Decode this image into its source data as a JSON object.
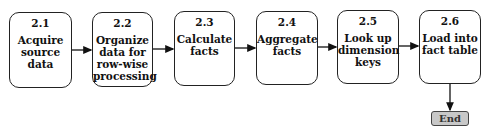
{
  "diagram": {
    "steps": [
      {
        "id": "2.1",
        "label": "Acquire source data",
        "lines": [
          "Acquire",
          "source",
          "data"
        ]
      },
      {
        "id": "2.2",
        "label": "Organize data for row-wise processing",
        "lines": [
          "Organize",
          "data for",
          "row-wise",
          "processing"
        ]
      },
      {
        "id": "2.3",
        "label": "Calculate facts",
        "lines": [
          "Calculate",
          "facts"
        ]
      },
      {
        "id": "2.4",
        "label": "Aggregate facts",
        "lines": [
          "Aggregate",
          "facts"
        ]
      },
      {
        "id": "2.5",
        "label": "Look up dimension keys",
        "lines": [
          "Look up",
          "dimension",
          "keys"
        ]
      },
      {
        "id": "2.6",
        "label": "Load into fact table",
        "lines": [
          "Load into",
          "fact table"
        ]
      }
    ],
    "end": {
      "label": "End"
    },
    "edges": [
      {
        "from": "2.1",
        "to": "2.2"
      },
      {
        "from": "2.2",
        "to": "2.3"
      },
      {
        "from": "2.3",
        "to": "2.4"
      },
      {
        "from": "2.4",
        "to": "2.5"
      },
      {
        "from": "2.5",
        "to": "2.6"
      },
      {
        "from": "2.6",
        "to": "End"
      }
    ],
    "colors": {
      "border": "#222222",
      "end_fill": "#c8c8c8"
    }
  }
}
